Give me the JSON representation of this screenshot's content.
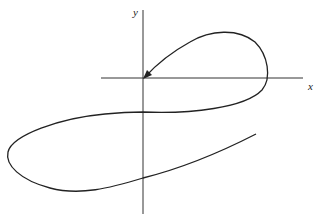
{
  "diagram": {
    "type": "parametric curve sketch",
    "axes": {
      "x_label": "x",
      "y_label": "y"
    },
    "curve": {
      "description": "Curve starting lower-right, looping left below x-axis, crossing y-axis twice, then looping upward to the right and ending with an arrow at the origin",
      "arrow_at": "origin"
    },
    "colors": {
      "line": "#222222",
      "axis": "#333333",
      "background": "#ffffff"
    }
  }
}
